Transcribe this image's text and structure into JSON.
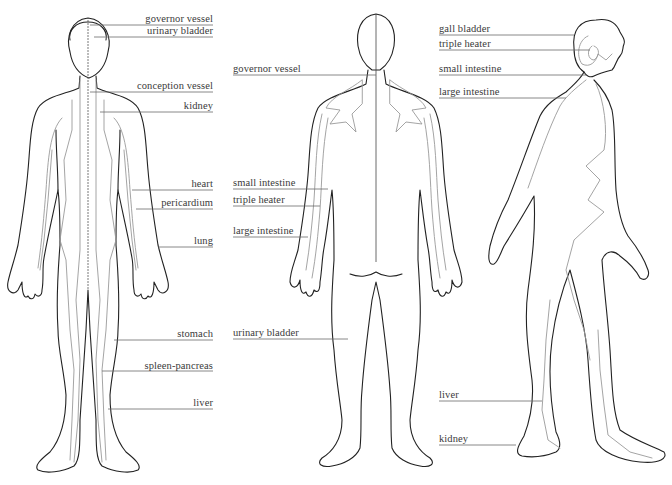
{
  "figures": {
    "front": {
      "view": "anterior",
      "labels": [
        {
          "text": "governor vessel",
          "x": 213,
          "y": 18
        },
        {
          "text": "urinary bladder",
          "x": 213,
          "y": 31
        },
        {
          "text": "conception vessel",
          "x": 213,
          "y": 85
        },
        {
          "text": "kidney",
          "x": 213,
          "y": 106
        },
        {
          "text": "heart",
          "x": 213,
          "y": 184
        },
        {
          "text": "pericardium",
          "x": 213,
          "y": 203
        },
        {
          "text": "lung",
          "x": 213,
          "y": 241
        },
        {
          "text": "stomach",
          "x": 213,
          "y": 338
        },
        {
          "text": "spleen-pancreas",
          "x": 213,
          "y": 370
        },
        {
          "text": "liver",
          "x": 213,
          "y": 405
        }
      ]
    },
    "back": {
      "view": "posterior",
      "labels": [
        {
          "text": "governor vessel",
          "x": 233,
          "y": 70
        },
        {
          "text": "small intestine",
          "x": 233,
          "y": 184
        },
        {
          "text": "triple heater",
          "x": 233,
          "y": 201
        },
        {
          "text": "large intestine",
          "x": 233,
          "y": 232
        },
        {
          "text": "urinary bladder",
          "x": 233,
          "y": 334
        }
      ]
    },
    "side": {
      "view": "lateral",
      "labels": [
        {
          "text": "gall bladder",
          "x": 439,
          "y": 30
        },
        {
          "text": "triple heater",
          "x": 439,
          "y": 45
        },
        {
          "text": "small intestine",
          "x": 439,
          "y": 70
        },
        {
          "text": "large intestine",
          "x": 439,
          "y": 93
        },
        {
          "text": "liver",
          "x": 439,
          "y": 396
        },
        {
          "text": "kidney",
          "x": 439,
          "y": 440
        }
      ]
    }
  },
  "colors": {
    "outline": "#222222",
    "meridian": "#9a9a9a",
    "text": "#3a3a3a",
    "background": "#ffffff"
  }
}
